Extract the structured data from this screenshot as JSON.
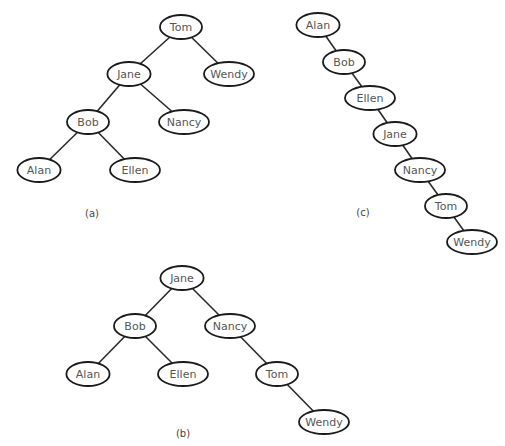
{
  "trees": [
    {
      "id": "a",
      "caption": "(a)",
      "caption_pos": [
        92,
        213
      ],
      "nodes": [
        {
          "label": "Tom",
          "x": 181,
          "y": 27
        },
        {
          "label": "Jane",
          "x": 129,
          "y": 74
        },
        {
          "label": "Wendy",
          "x": 229,
          "y": 74
        },
        {
          "label": "Bob",
          "x": 88,
          "y": 122
        },
        {
          "label": "Nancy",
          "x": 184,
          "y": 122
        },
        {
          "label": "Alan",
          "x": 39,
          "y": 170
        },
        {
          "label": "Ellen",
          "x": 135,
          "y": 170
        }
      ],
      "edges": [
        [
          "Tom",
          "Jane"
        ],
        [
          "Tom",
          "Wendy"
        ],
        [
          "Jane",
          "Bob"
        ],
        [
          "Jane",
          "Nancy"
        ],
        [
          "Bob",
          "Alan"
        ],
        [
          "Bob",
          "Ellen"
        ]
      ]
    },
    {
      "id": "b",
      "caption": "(b)",
      "caption_pos": [
        183,
        433
      ],
      "nodes": [
        {
          "label": "Jane",
          "x": 182,
          "y": 278
        },
        {
          "label": "Bob",
          "x": 135,
          "y": 326
        },
        {
          "label": "Nancy",
          "x": 230,
          "y": 326
        },
        {
          "label": "Alan",
          "x": 88,
          "y": 374
        },
        {
          "label": "Ellen",
          "x": 183,
          "y": 374
        },
        {
          "label": "Tom",
          "x": 277,
          "y": 374
        },
        {
          "label": "Wendy",
          "x": 324,
          "y": 422
        }
      ],
      "edges": [
        [
          "Jane",
          "Bob"
        ],
        [
          "Jane",
          "Nancy"
        ],
        [
          "Bob",
          "Alan"
        ],
        [
          "Bob",
          "Ellen"
        ],
        [
          "Nancy",
          "Tom"
        ],
        [
          "Tom",
          "Wendy"
        ]
      ]
    },
    {
      "id": "c",
      "caption": "(c)",
      "caption_pos": [
        363,
        212
      ],
      "nodes": [
        {
          "label": "Alan",
          "x": 318,
          "y": 25
        },
        {
          "label": "Bob",
          "x": 344,
          "y": 62
        },
        {
          "label": "Ellen",
          "x": 370,
          "y": 98
        },
        {
          "label": "Jane",
          "x": 395,
          "y": 134
        },
        {
          "label": "Nancy",
          "x": 420,
          "y": 170
        },
        {
          "label": "Tom",
          "x": 446,
          "y": 206
        },
        {
          "label": "Wendy",
          "x": 472,
          "y": 242
        }
      ],
      "edges": [
        [
          "Alan",
          "Bob"
        ],
        [
          "Bob",
          "Ellen"
        ],
        [
          "Ellen",
          "Jane"
        ],
        [
          "Jane",
          "Nancy"
        ],
        [
          "Nancy",
          "Tom"
        ],
        [
          "Tom",
          "Wendy"
        ]
      ]
    }
  ],
  "node_size": {
    "rx": 21,
    "ry": 12
  }
}
